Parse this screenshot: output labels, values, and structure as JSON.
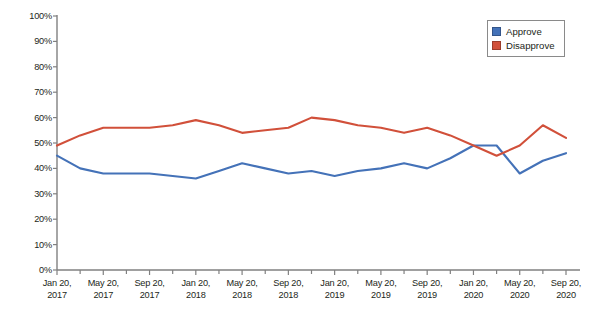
{
  "chart_data": {
    "type": "line",
    "title": "",
    "xlabel": "",
    "ylabel": "Percentage approving Trump's performance in office",
    "ylim": [
      0,
      100
    ],
    "ytick_labels": [
      "100%",
      "90%",
      "80%",
      "70%",
      "60%",
      "50%",
      "40%",
      "30%",
      "20%",
      "10%",
      "0%"
    ],
    "ytick_values": [
      100,
      90,
      80,
      70,
      60,
      50,
      40,
      30,
      20,
      10,
      0
    ],
    "grid": false,
    "legend_position": "top-right",
    "x_tick_labels": [
      {
        "line1": "Jan 20,",
        "line2": "2017"
      },
      {
        "line1": "May 20,",
        "line2": "2017"
      },
      {
        "line1": "Sep 20,",
        "line2": "2017"
      },
      {
        "line1": "Jan 20,",
        "line2": "2018"
      },
      {
        "line1": "May 20,",
        "line2": "2018"
      },
      {
        "line1": "Sep 20,",
        "line2": "2018"
      },
      {
        "line1": "Jan 20,",
        "line2": "2019"
      },
      {
        "line1": "May 20,",
        "line2": "2019"
      },
      {
        "line1": "Sep 20,",
        "line2": "2019"
      },
      {
        "line1": "Jan 20,",
        "line2": "2020"
      },
      {
        "line1": "May 20,",
        "line2": "2020"
      },
      {
        "line1": "Sep 20,",
        "line2": "2020"
      }
    ],
    "x": [
      "Jan 20, 2017",
      "Mar 20, 2017",
      "May 20, 2017",
      "Jul 20, 2017",
      "Sep 20, 2017",
      "Nov 20, 2017",
      "Jan 20, 2018",
      "Mar 20, 2018",
      "May 20, 2018",
      "Jul 20, 2018",
      "Sep 20, 2018",
      "Nov 20, 2018",
      "Jan 20, 2019",
      "Mar 20, 2019",
      "May 20, 2019",
      "Jul 20, 2019",
      "Sep 20, 2019",
      "Nov 20, 2019",
      "Jan 20, 2020",
      "Mar 20, 2020",
      "May 20, 2020",
      "Jul 20, 2020",
      "Sep 20, 2020"
    ],
    "series": [
      {
        "name": "Approve",
        "color": "#4472b8",
        "values": [
          45,
          40,
          38,
          38,
          38,
          37,
          36,
          39,
          42,
          40,
          38,
          39,
          37,
          39,
          40,
          42,
          40,
          44,
          49,
          49,
          38,
          43,
          46
        ]
      },
      {
        "name": "Disapprove",
        "color": "#d1503a",
        "values": [
          49,
          53,
          56,
          56,
          56,
          57,
          59,
          57,
          54,
          55,
          56,
          60,
          59,
          57,
          56,
          54,
          56,
          53,
          49,
          45,
          49,
          57,
          52
        ]
      }
    ]
  },
  "legend": {
    "items": [
      {
        "label": "Approve",
        "color": "#4472b8"
      },
      {
        "label": "Disapprove",
        "color": "#d1503a"
      }
    ]
  },
  "axis": {
    "y_title": "Percentage approving Trump's performance in office"
  }
}
